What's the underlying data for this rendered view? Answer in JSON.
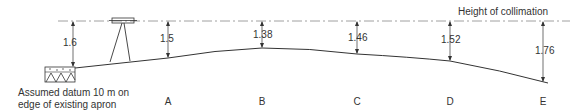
{
  "title": "Height of collimation",
  "datum_label": [
    "Assumed datum 10 m on",
    "edge of existing apron"
  ],
  "datum_measure": "1.6",
  "stations": [
    {
      "name": "A",
      "x": 168,
      "measure": "1.5"
    },
    {
      "name": "B",
      "x": 262,
      "measure": "1.38"
    },
    {
      "name": "C",
      "x": 357,
      "measure": "1.46"
    },
    {
      "name": "D",
      "x": 450,
      "measure": "1.52"
    },
    {
      "name": "E",
      "x": 543,
      "measure": "1.76"
    }
  ],
  "colors": {
    "line": "#333333",
    "collimation": "#777777"
  }
}
